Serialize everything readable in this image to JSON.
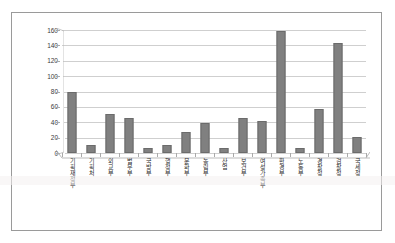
{
  "chart_data": {
    "type": "bar",
    "title": "",
    "subtitle": "",
    "xlabel": "",
    "ylabel": "",
    "ylim": [
      0,
      160
    ],
    "ytick_step": 20,
    "ytick_labels": [
      "0",
      "20",
      "40",
      "60",
      "80",
      "100",
      "120",
      "140",
      "160"
    ],
    "grid": true,
    "legend": "none",
    "bar_color": "#808080",
    "bar_border_color": "#6b6b6b",
    "gridline_color": "#cfcfcf",
    "axis_color": "#a9a9a9",
    "plot_background": "#ffffff",
    "categories": [
      "기획재정부",
      "기획처",
      "외교부",
      "법무부",
      "국방부",
      "행정부",
      "문화부",
      "농림부",
      "산업",
      "보건부",
      "여성가족부",
      "환경부",
      "노동부",
      "경찰청",
      "검찰청",
      "국세청"
    ],
    "values": [
      80,
      11,
      51,
      46,
      6,
      11,
      27,
      39,
      6,
      46,
      42,
      159,
      6,
      57,
      143,
      21
    ],
    "series": [
      {
        "name": "건수",
        "values": [
          80,
          11,
          51,
          46,
          6,
          11,
          27,
          39,
          6,
          46,
          42,
          159,
          6,
          57,
          143,
          21
        ]
      }
    ]
  },
  "figure": {
    "border_color": "#9a9a9a",
    "background": "#ffffff"
  }
}
